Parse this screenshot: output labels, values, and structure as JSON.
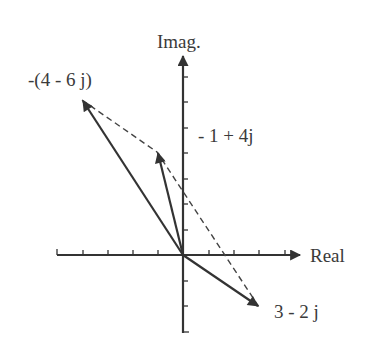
{
  "figure": {
    "type": "complex-plane-phasor-diagram",
    "axes": {
      "x_label": "Real",
      "y_label": "Imag.",
      "x_ticks": [
        -5,
        -4,
        -3,
        -2,
        -1,
        1,
        2,
        3,
        4
      ],
      "y_ticks": [
        -3,
        -2,
        -1,
        1,
        2,
        3,
        4,
        5,
        6
      ]
    },
    "vectors": [
      {
        "label": "-(4 - 6 j)",
        "real": -4,
        "imag": 6
      },
      {
        "label": "- 1 + 4j",
        "real": -1,
        "imag": 4
      },
      {
        "label": "3 - 2 j",
        "real": 3,
        "imag": -2
      }
    ],
    "dashed_path": "Parallelogram-style construction connecting -(4-6j) tip to -1+4j tip to 3-2j tip",
    "colors": {
      "ink": "#333333",
      "background": "#ffffff"
    }
  }
}
